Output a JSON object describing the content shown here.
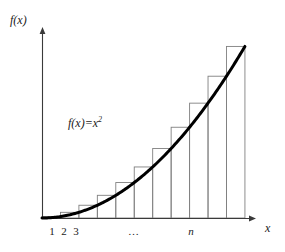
{
  "figure": {
    "background_color": "#ffffff",
    "ink_color": "#1a1a1a",
    "curve_color": "#000000",
    "bar_stroke_color": "#808080"
  },
  "axes": {
    "y_label": "f(x)",
    "x_label": "x",
    "origin_px": {
      "x": 42,
      "y": 218
    },
    "x_axis_end_px": {
      "x": 256,
      "y": 218
    },
    "y_axis_top_px": {
      "x": 42,
      "y": 28
    },
    "arrowheads": true,
    "grid": false
  },
  "annotation": {
    "function_label_base": "f(x)=x",
    "function_label_exponent": "2",
    "function_label_full": "f(x)=x²"
  },
  "tick_labels": [
    {
      "text": "1",
      "x_px": 52,
      "italic": false
    },
    {
      "text": "2",
      "x_px": 64,
      "italic": false
    },
    {
      "text": "3",
      "x_px": 76,
      "italic": false
    },
    {
      "text": "…",
      "x_px": 134,
      "italic": false
    },
    {
      "text": "n",
      "x_px": 191,
      "italic": true
    }
  ],
  "chart_data": {
    "type": "bar",
    "title": "",
    "subtitle": "",
    "xlabel": "x",
    "ylabel": "f(x)",
    "grid": false,
    "legend": false,
    "annotations": [
      {
        "text": "f(x)=x²",
        "x_px": 68,
        "y_px": 117
      }
    ],
    "function_expression": "f(x) = x^2",
    "curve": {
      "name": "f(x)=x²",
      "type": "line",
      "color": "#000000",
      "line_width": 3,
      "x": [
        0,
        1,
        2,
        3,
        4,
        5,
        6,
        7,
        8,
        9,
        10,
        11
      ],
      "y": [
        0,
        1,
        4,
        9,
        16,
        25,
        36,
        49,
        64,
        81,
        100,
        121
      ]
    },
    "bars": {
      "name": "right-endpoint rectangles",
      "rule": "right-endpoint Riemann sum",
      "count": 11,
      "width": 1,
      "categories": [
        "1",
        "2",
        "3",
        "4",
        "5",
        "6",
        "7",
        "8",
        "9",
        "10",
        "n"
      ],
      "values": [
        1,
        4,
        9,
        16,
        25,
        36,
        49,
        64,
        81,
        100,
        121
      ],
      "fill": "none",
      "stroke": "#808080"
    },
    "xlim": [
      0,
      11.6
    ],
    "ylim": [
      0,
      134
    ],
    "x_tick_labels": [
      "1",
      "2",
      "3",
      "…",
      "n"
    ]
  }
}
